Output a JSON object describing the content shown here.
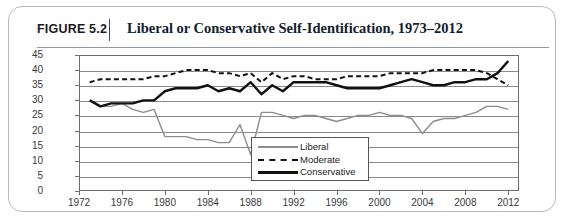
{
  "figure": {
    "number": "FIGURE 5.2",
    "title": "Liberal or Conservative Self-Identification, 1973–2012"
  },
  "legend": {
    "items": [
      {
        "label": "Liberal",
        "style": "solid-thin-gray",
        "color": "#8c8c8c"
      },
      {
        "label": "Moderate",
        "style": "dashed-black",
        "color": "#111111"
      },
      {
        "label": "Conservative",
        "style": "solid-thick-black",
        "color": "#111111"
      }
    ],
    "position": "inside-center-right"
  },
  "chart_data": {
    "type": "line",
    "title": "Liberal or Conservative Self-Identification, 1973–2012",
    "xlabel": "",
    "ylabel": "",
    "xlim": [
      1972,
      2013
    ],
    "ylim": [
      0,
      45
    ],
    "yticks": [
      0,
      5,
      10,
      15,
      20,
      25,
      30,
      35,
      40,
      45
    ],
    "xticks": [
      1972,
      1976,
      1980,
      1984,
      1988,
      1992,
      1996,
      2000,
      2004,
      2008,
      2012
    ],
    "grid": true,
    "x": [
      1973,
      1974,
      1975,
      1976,
      1977,
      1978,
      1979,
      1980,
      1981,
      1982,
      1983,
      1984,
      1985,
      1986,
      1987,
      1988,
      1989,
      1990,
      1991,
      1992,
      1993,
      1994,
      1995,
      1996,
      1997,
      1998,
      1999,
      2000,
      2001,
      2002,
      2003,
      2004,
      2005,
      2006,
      2007,
      2008,
      2009,
      2010,
      2011,
      2012
    ],
    "series": [
      {
        "name": "Liberal",
        "color": "#8c8c8c",
        "style": "solid-thin-gray",
        "values": [
          30,
          28,
          28,
          29,
          27,
          26,
          27,
          18,
          18,
          18,
          17,
          17,
          16,
          16,
          22,
          12,
          26,
          26,
          25,
          24,
          25,
          25,
          24,
          23,
          24,
          25,
          25,
          26,
          25,
          25,
          24,
          19,
          23,
          24,
          24,
          25,
          26,
          28,
          28,
          27
        ]
      },
      {
        "name": "Moderate",
        "color": "#111111",
        "style": "dashed-black",
        "values": [
          36,
          37,
          37,
          37,
          37,
          37,
          38,
          38,
          39,
          40,
          40,
          40,
          39,
          39,
          38,
          39,
          36,
          39,
          37,
          38,
          38,
          37,
          37,
          37,
          38,
          38,
          38,
          38,
          39,
          39,
          39,
          39,
          40,
          40,
          40,
          40,
          40,
          39,
          37,
          35
        ]
      },
      {
        "name": "Conservative",
        "color": "#111111",
        "style": "solid-thick-black",
        "values": [
          30,
          28,
          29,
          29,
          29,
          30,
          30,
          33,
          34,
          34,
          34,
          35,
          33,
          34,
          33,
          36,
          32,
          35,
          33,
          36,
          36,
          36,
          36,
          35,
          34,
          34,
          34,
          34,
          35,
          36,
          37,
          36,
          35,
          35,
          36,
          36,
          37,
          37,
          39,
          43
        ]
      }
    ]
  },
  "axes": {
    "ytick_labels": [
      "45",
      "40",
      "35",
      "30",
      "25",
      "20",
      "15",
      "10",
      "5",
      "0"
    ],
    "xtick_labels": [
      "1972",
      "1976",
      "1980",
      "1984",
      "1988",
      "1992",
      "1996",
      "2000",
      "2004",
      "2008",
      "2012"
    ]
  }
}
